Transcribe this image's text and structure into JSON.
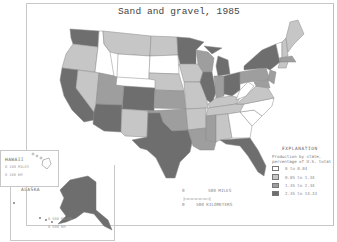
{
  "map": {
    "title": "Sand and gravel, 1985",
    "colors": {
      "class1": "#ffffff",
      "class2": "#c6c6c6",
      "class3": "#9e9e9e",
      "class4": "#6e6e6e",
      "border": "#888888"
    }
  },
  "legend": {
    "heading": "EXPLANATION",
    "subtitle": "Production by state, percentage of U.S. total",
    "items": [
      {
        "label": "0 to 0.84",
        "color": "#ffffff"
      },
      {
        "label": "0.85 to 1.34",
        "color": "#c6c6c6"
      },
      {
        "label": "1.35 to 2.34",
        "color": "#9e9e9e"
      },
      {
        "label": "2.35 to 14.33",
        "color": "#6e6e6e"
      }
    ]
  },
  "scale_bar": {
    "miles_zero": "0",
    "miles_label": "500 MILES",
    "km_zero": "0",
    "km_label": "500 KILOMETERS"
  },
  "insets": {
    "hawaii": {
      "label": "HAWAII",
      "scale_miles": "0   100 MILES",
      "scale_km": "0 100 KM"
    },
    "alaska": {
      "label": "ALASKA",
      "scale_miles": "0     500 MILES",
      "scale_km": "0     500 KM"
    }
  }
}
